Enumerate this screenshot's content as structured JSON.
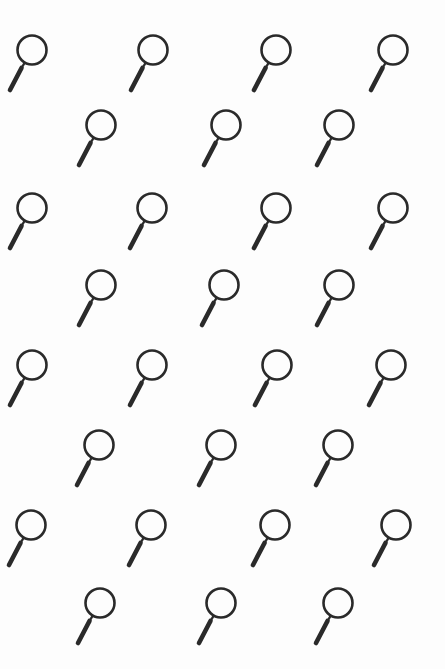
{
  "page": {
    "background": "#fdfdfd",
    "icon_color": "#2a2a2a",
    "icon_name": "magnifying-glass-icon"
  },
  "pattern": {
    "rows": [
      {
        "y": 50,
        "xs": [
          32,
          153,
          276,
          393
        ]
      },
      {
        "y": 125,
        "xs": [
          101,
          226,
          339
        ]
      },
      {
        "y": 208,
        "xs": [
          32,
          152,
          276,
          393
        ]
      },
      {
        "y": 285,
        "xs": [
          101,
          224,
          339
        ]
      },
      {
        "y": 365,
        "xs": [
          32,
          152,
          277,
          391
        ]
      },
      {
        "y": 445,
        "xs": [
          99,
          221,
          338
        ]
      },
      {
        "y": 525,
        "xs": [
          31,
          151,
          275,
          396
        ]
      },
      {
        "y": 603,
        "xs": [
          100,
          221,
          338
        ]
      }
    ]
  }
}
